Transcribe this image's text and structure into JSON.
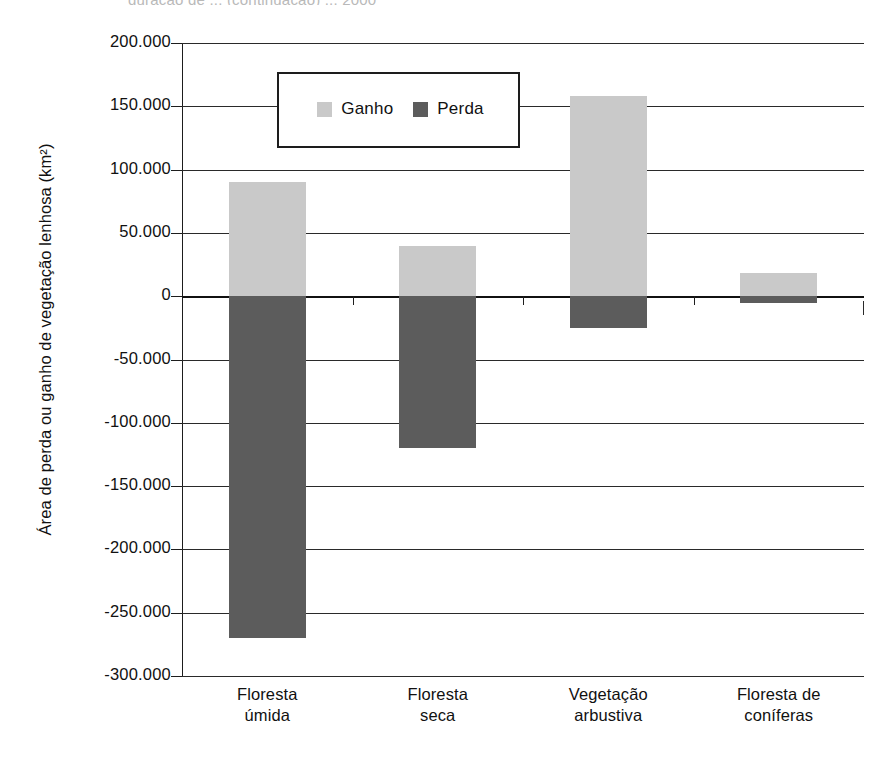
{
  "caption_fragment": "guração de ... (continuação) ... 2000",
  "chart_data": {
    "type": "bar",
    "title": "",
    "subtitle": "",
    "xlabel": "",
    "ylabel": "Área de perda ou ganho de vegetação lenhosa (km²)",
    "categories": [
      "Floresta úmida",
      "Floresta seca",
      "Vegetação arbustiva",
      "Floresta de coníferas"
    ],
    "categories_lines": [
      [
        "Floresta",
        "úmida"
      ],
      [
        "Floresta",
        "seca"
      ],
      [
        "Vegetação",
        "arbustiva"
      ],
      [
        "Floresta de",
        "coníferas"
      ]
    ],
    "series": [
      {
        "name": "Ganho",
        "color": "#c9c9c9",
        "values": [
          90000,
          40000,
          158000,
          18000
        ]
      },
      {
        "name": "Perda",
        "color": "#5c5c5c",
        "values": [
          -270000,
          -120000,
          -25000,
          -5000
        ]
      }
    ],
    "ylim": [
      -300000,
      200000
    ],
    "ytick_values": [
      200000,
      150000,
      100000,
      50000,
      0,
      -50000,
      -100000,
      -150000,
      -200000,
      -250000,
      -300000
    ],
    "ytick_labels": [
      "200.000",
      "150.000",
      "100.000",
      "50.000",
      "0",
      "-50.000",
      "-100.000",
      "-150.000",
      "-200.000",
      "-250.000",
      "-300.000"
    ],
    "grid": true,
    "legend_position": "upper-center-inside",
    "legend_entries": [
      {
        "label": "Ganho",
        "color": "#c9c9c9"
      },
      {
        "label": "Perda",
        "color": "#5c5c5c"
      }
    ]
  }
}
